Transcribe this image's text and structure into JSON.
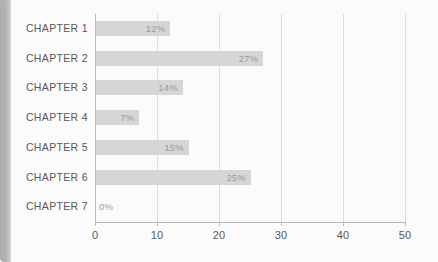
{
  "chart_data": {
    "type": "bar",
    "orientation": "horizontal",
    "title": "",
    "subtitle": "",
    "xlabel": "",
    "ylabel": "",
    "categories": [
      "CHAPTER 1",
      "CHAPTER 2",
      "CHAPTER 3",
      "CHAPTER 4",
      "CHAPTER 5",
      "CHAPTER 6",
      "CHAPTER 7"
    ],
    "values": [
      12,
      27,
      14,
      7,
      15,
      25,
      0
    ],
    "data_labels": [
      "12%",
      "27%",
      "14%",
      "7%",
      "15%",
      "25%",
      "0%"
    ],
    "xlim": [
      0,
      50
    ],
    "xticks": [
      0,
      10,
      20,
      30,
      40,
      50
    ],
    "xtick_labels": [
      "0",
      "10",
      "20",
      "30",
      "40",
      "50"
    ],
    "grid": "vertical",
    "legend": "none",
    "bar_color": "#d6d6d6",
    "label_color": "#58585a",
    "value_color": "#9b9b9b",
    "gridline_color": "#dcdcdc",
    "axis_color": "#b6b6b6",
    "background_color": "#fbfbfb"
  },
  "card": {
    "edge_color": "#b0b0b0"
  }
}
